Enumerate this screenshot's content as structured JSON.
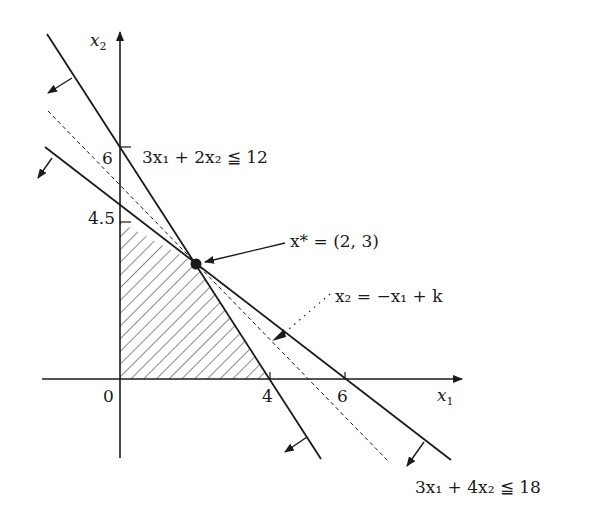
{
  "axes": {
    "x_label": "x",
    "x_sub": "1",
    "y_label": "x",
    "y_sub": "2",
    "origin_label": "0",
    "x_ticks": [
      "4",
      "6"
    ],
    "y_ticks": [
      "6",
      "4.5"
    ]
  },
  "constraints": [
    {
      "label": "3x₁ + 2x₂ ≦ 12",
      "x_intercept": 4,
      "y_intercept": 6
    },
    {
      "label": "3x₁ + 4x₂ ≦ 18",
      "x_intercept": 6,
      "y_intercept": 4.5
    }
  ],
  "optimum": {
    "label": "x* = (2, 3)",
    "x": 2,
    "y": 3
  },
  "objective": {
    "label": "x₂ = −x₁ + k"
  },
  "feasible_region": {
    "vertices": [
      [
        0,
        0
      ],
      [
        4,
        0
      ],
      [
        2,
        3
      ],
      [
        0,
        4.5
      ]
    ],
    "fill": "hatched"
  },
  "colors": {
    "ink": "#1a1a1a",
    "background": "#ffffff"
  }
}
